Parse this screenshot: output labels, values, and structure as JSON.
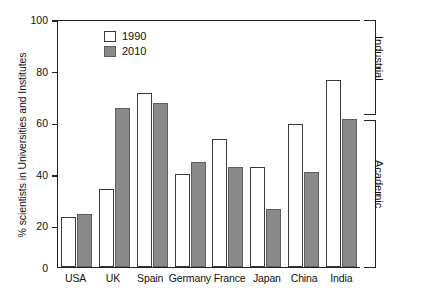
{
  "chart_data": {
    "type": "bar",
    "title": "",
    "xlabel": "",
    "ylabel": "% scientists in Universities and Institutes",
    "ylim": [
      0,
      100
    ],
    "yticks": [
      0,
      20,
      40,
      60,
      80,
      100
    ],
    "grid": false,
    "legend_position": "top-left",
    "categories": [
      "USA",
      "UK",
      "Spain",
      "Germany",
      "France",
      "Japan",
      "China",
      "India"
    ],
    "series": [
      {
        "name": "1990",
        "color": "#ffffff",
        "values": [
          20,
          31.5,
          70,
          37.5,
          51.5,
          40.5,
          57.5,
          75.5
        ]
      },
      {
        "name": "2010",
        "color": "#8a8a8a",
        "values": [
          21.5,
          64,
          66,
          42.5,
          40.5,
          23.5,
          38.5,
          59.5
        ]
      }
    ],
    "annotations": [
      {
        "label": "Industrial",
        "range": [
          60,
          100
        ]
      },
      {
        "label": "Academic",
        "range": [
          0,
          60
        ]
      }
    ]
  }
}
